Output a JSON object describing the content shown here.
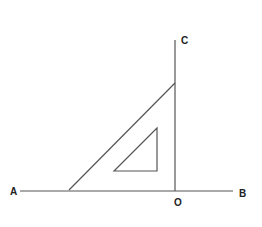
{
  "diagram": {
    "type": "geometry-construction",
    "labels": {
      "A": "A",
      "B": "B",
      "C": "C",
      "O": "O"
    },
    "points": {
      "A": [
        20,
        191
      ],
      "B": [
        233,
        191
      ],
      "O": [
        175,
        191
      ],
      "C": [
        175,
        40
      ]
    },
    "set_square": {
      "outer": [
        [
          69,
          190
        ],
        [
          175,
          83
        ],
        [
          175,
          190
        ]
      ],
      "inner": [
        [
          114,
          171
        ],
        [
          157,
          128
        ],
        [
          157,
          171
        ]
      ]
    },
    "colors": {
      "line": "#555555",
      "label": "#222222",
      "background": "#ffffff"
    }
  }
}
